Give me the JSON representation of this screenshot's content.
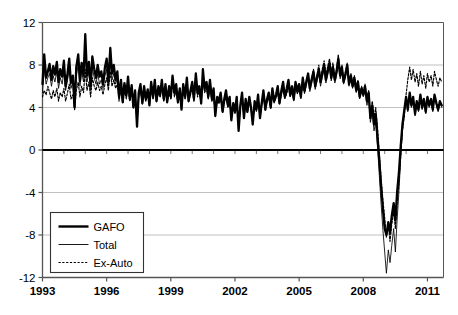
{
  "chart_data": {
    "type": "line",
    "title": "",
    "subtitle": "",
    "xlabel": "",
    "ylabel": "",
    "xlim": [
      1993.0,
      2011.75
    ],
    "ylim": [
      -12,
      12
    ],
    "ytick_values": [
      12,
      8,
      4,
      0,
      -4,
      -8,
      -12
    ],
    "ytick_labels": [
      "12",
      "8",
      "4",
      "0",
      "-4",
      "-8",
      "-12"
    ],
    "xtick_values": [
      1993,
      1996,
      1999,
      2002,
      2005,
      2008,
      2011
    ],
    "xtick_labels": [
      "1993",
      "1996",
      "1999",
      "2002",
      "2005",
      "2008",
      "2011"
    ],
    "minor_xtick_interval": 1,
    "grid": "horizontal-only",
    "grid_color": "#b0b0b0",
    "zero_line": true,
    "zero_line_color": "#000000",
    "axis_color": "#555555",
    "legend": {
      "position": "lower-left-inside",
      "border_color": "#333333",
      "entries": [
        {
          "label": "GAFO",
          "style": "thick-solid",
          "color": "#000000",
          "width": 2.4
        },
        {
          "label": "Total",
          "style": "thin-solid",
          "color": "#000000",
          "width": 0.9
        },
        {
          "label": "Ex-Auto",
          "style": "dotted",
          "color": "#000000",
          "width": 1.1
        }
      ]
    },
    "x": [
      1993.0,
      1993.08,
      1993.17,
      1993.25,
      1993.33,
      1993.42,
      1993.5,
      1993.58,
      1993.67,
      1993.75,
      1993.83,
      1993.92,
      1994.0,
      1994.08,
      1994.17,
      1994.25,
      1994.33,
      1994.42,
      1994.5,
      1994.58,
      1994.67,
      1994.75,
      1994.83,
      1994.92,
      1995.0,
      1995.08,
      1995.17,
      1995.25,
      1995.33,
      1995.42,
      1995.5,
      1995.58,
      1995.67,
      1995.75,
      1995.83,
      1995.92,
      1996.0,
      1996.08,
      1996.17,
      1996.25,
      1996.33,
      1996.42,
      1996.5,
      1996.58,
      1996.67,
      1996.75,
      1996.83,
      1996.92,
      1997.0,
      1997.08,
      1997.17,
      1997.25,
      1997.33,
      1997.42,
      1997.5,
      1997.58,
      1997.67,
      1997.75,
      1997.83,
      1997.92,
      1998.0,
      1998.08,
      1998.17,
      1998.25,
      1998.33,
      1998.42,
      1998.5,
      1998.58,
      1998.67,
      1998.75,
      1998.83,
      1998.92,
      1999.0,
      1999.08,
      1999.17,
      1999.25,
      1999.33,
      1999.42,
      1999.5,
      1999.58,
      1999.67,
      1999.75,
      1999.83,
      1999.92,
      2000.0,
      2000.08,
      2000.17,
      2000.25,
      2000.33,
      2000.42,
      2000.5,
      2000.58,
      2000.67,
      2000.75,
      2000.83,
      2000.92,
      2001.0,
      2001.08,
      2001.17,
      2001.25,
      2001.33,
      2001.42,
      2001.5,
      2001.58,
      2001.67,
      2001.75,
      2001.83,
      2001.92,
      2002.0,
      2002.08,
      2002.17,
      2002.25,
      2002.33,
      2002.42,
      2002.5,
      2002.58,
      2002.67,
      2002.75,
      2002.83,
      2002.92,
      2003.0,
      2003.08,
      2003.17,
      2003.25,
      2003.33,
      2003.42,
      2003.5,
      2003.58,
      2003.67,
      2003.75,
      2003.83,
      2003.92,
      2004.0,
      2004.08,
      2004.17,
      2004.25,
      2004.33,
      2004.42,
      2004.5,
      2004.58,
      2004.67,
      2004.75,
      2004.83,
      2004.92,
      2005.0,
      2005.08,
      2005.17,
      2005.25,
      2005.33,
      2005.42,
      2005.5,
      2005.58,
      2005.67,
      2005.75,
      2005.83,
      2005.92,
      2006.0,
      2006.08,
      2006.17,
      2006.25,
      2006.33,
      2006.42,
      2006.5,
      2006.58,
      2006.67,
      2006.75,
      2006.83,
      2006.92,
      2007.0,
      2007.08,
      2007.17,
      2007.25,
      2007.33,
      2007.42,
      2007.5,
      2007.58,
      2007.67,
      2007.75,
      2007.83,
      2007.92,
      2008.0,
      2008.08,
      2008.17,
      2008.25,
      2008.33,
      2008.42,
      2008.5,
      2008.58,
      2008.67,
      2008.75,
      2008.83,
      2008.92,
      2009.0,
      2009.08,
      2009.17,
      2009.25,
      2009.33,
      2009.42,
      2009.5,
      2009.58,
      2009.67,
      2009.75,
      2009.83,
      2009.92,
      2010.0,
      2010.08,
      2010.17,
      2010.25,
      2010.33,
      2010.42,
      2010.5,
      2010.58,
      2010.67,
      2010.75,
      2010.83,
      2010.92,
      2011.0,
      2011.08,
      2011.17,
      2011.25,
      2011.33,
      2011.42,
      2011.5,
      2011.58,
      2011.67
    ],
    "series": [
      {
        "name": "GAFO",
        "style": "thick-solid",
        "values": [
          6.2,
          9.0,
          6.8,
          7.4,
          8.1,
          6.6,
          7.9,
          7.1,
          8.3,
          6.4,
          7.6,
          6.9,
          8.4,
          6.0,
          7.2,
          8.6,
          6.3,
          7.0,
          4.0,
          7.8,
          9.0,
          6.5,
          8.2,
          7.0,
          10.9,
          7.0,
          8.3,
          6.0,
          8.8,
          7.6,
          6.8,
          8.0,
          6.9,
          7.4,
          6.2,
          7.8,
          8.6,
          6.4,
          9.6,
          7.2,
          8.0,
          6.6,
          7.4,
          5.0,
          6.6,
          4.5,
          6.3,
          5.2,
          6.9,
          4.8,
          6.1,
          4.0,
          5.6,
          2.2,
          5.4,
          6.2,
          4.4,
          6.0,
          4.8,
          5.7,
          4.2,
          6.4,
          5.0,
          6.6,
          4.6,
          6.0,
          5.2,
          6.6,
          4.8,
          6.2,
          4.5,
          6.0,
          5.0,
          7.0,
          5.4,
          6.2,
          4.5,
          5.8,
          3.8,
          6.2,
          5.0,
          6.8,
          4.6,
          5.6,
          6.4,
          4.8,
          7.2,
          5.4,
          6.0,
          4.4,
          7.6,
          5.8,
          6.4,
          5.0,
          6.6,
          4.8,
          5.8,
          3.2,
          5.0,
          4.6,
          5.4,
          3.6,
          4.8,
          5.6,
          4.2,
          5.0,
          2.8,
          4.4,
          3.6,
          5.0,
          1.8,
          4.2,
          5.4,
          3.0,
          4.8,
          3.6,
          5.0,
          4.0,
          2.4,
          4.6,
          3.8,
          5.2,
          3.0,
          4.4,
          5.6,
          3.8,
          4.8,
          5.4,
          4.0,
          5.8,
          4.6,
          5.2,
          6.0,
          4.4,
          5.6,
          6.4,
          5.0,
          5.8,
          6.6,
          5.2,
          6.0,
          4.8,
          6.4,
          5.6,
          6.2,
          5.0,
          6.8,
          5.6,
          6.4,
          7.2,
          5.8,
          6.6,
          7.4,
          6.0,
          6.8,
          7.6,
          6.4,
          7.2,
          8.0,
          6.6,
          7.4,
          8.2,
          6.8,
          7.8,
          6.6,
          7.4,
          8.6,
          7.0,
          7.8,
          6.4,
          7.2,
          8.0,
          6.2,
          7.0,
          6.0,
          6.8,
          5.6,
          6.4,
          5.0,
          5.8,
          5.2,
          6.0,
          4.6,
          5.4,
          3.0,
          4.2,
          2.4,
          3.4,
          1.0,
          -1.0,
          -3.4,
          -5.6,
          -7.4,
          -8.0,
          -6.8,
          -7.8,
          -6.2,
          -5.0,
          -6.6,
          -4.0,
          -2.0,
          0.4,
          2.4,
          3.8,
          5.0,
          3.8,
          5.4,
          4.2,
          5.0,
          3.4,
          4.6,
          3.8,
          5.2,
          4.0,
          4.8,
          3.6,
          5.0,
          4.2,
          4.8,
          3.8,
          5.2,
          4.4,
          3.8,
          4.6,
          4.2
        ]
      },
      {
        "name": "Total",
        "style": "thin-solid",
        "values": [
          5.4,
          7.6,
          6.2,
          6.8,
          7.2,
          6.0,
          7.0,
          6.4,
          7.4,
          5.8,
          6.8,
          6.2,
          7.4,
          5.6,
          6.6,
          7.6,
          5.8,
          6.4,
          3.8,
          7.0,
          8.0,
          6.0,
          7.4,
          6.4,
          9.4,
          6.4,
          7.4,
          5.6,
          7.8,
          6.8,
          6.2,
          7.2,
          6.2,
          6.6,
          5.8,
          7.0,
          7.6,
          6.0,
          8.4,
          6.6,
          7.2,
          6.2,
          6.8,
          4.8,
          6.2,
          4.4,
          6.0,
          5.0,
          6.4,
          4.6,
          5.8,
          4.0,
          5.4,
          2.4,
          5.2,
          5.8,
          4.3,
          5.6,
          4.6,
          5.4,
          4.2,
          6.0,
          4.8,
          6.2,
          4.5,
          5.6,
          5.0,
          6.2,
          4.6,
          5.8,
          4.4,
          5.6,
          4.8,
          6.6,
          5.2,
          5.8,
          4.4,
          5.4,
          3.8,
          5.8,
          4.8,
          6.4,
          4.5,
          5.4,
          6.0,
          4.6,
          6.8,
          5.2,
          5.7,
          4.3,
          7.0,
          5.5,
          6.0,
          4.8,
          6.2,
          4.6,
          5.4,
          3.2,
          4.8,
          4.4,
          5.0,
          3.5,
          4.6,
          5.2,
          4.0,
          4.8,
          2.9,
          4.2,
          3.4,
          4.8,
          2.0,
          4.0,
          5.0,
          3.0,
          4.5,
          3.5,
          4.7,
          3.8,
          2.5,
          4.3,
          3.6,
          4.8,
          3.0,
          4.2,
          5.2,
          3.7,
          4.6,
          5.0,
          3.9,
          5.4,
          4.4,
          5.0,
          5.6,
          4.3,
          5.2,
          6.0,
          4.8,
          5.4,
          6.2,
          5.0,
          5.6,
          4.6,
          6.0,
          5.3,
          5.8,
          4.8,
          6.4,
          5.3,
          6.0,
          6.8,
          5.5,
          6.2,
          7.0,
          5.7,
          6.4,
          7.2,
          6.0,
          6.8,
          7.6,
          6.3,
          7.0,
          7.8,
          6.5,
          7.4,
          6.3,
          7.0,
          8.2,
          6.7,
          7.4,
          6.2,
          6.9,
          7.6,
          6.0,
          6.7,
          5.8,
          6.5,
          5.4,
          6.2,
          4.8,
          5.6,
          5.0,
          5.6,
          4.2,
          5.0,
          2.6,
          3.6,
          1.8,
          2.6,
          0.2,
          -2.4,
          -5.0,
          -7.6,
          -9.6,
          -11.6,
          -9.4,
          -10.6,
          -9.0,
          -7.4,
          -9.6,
          -6.6,
          -3.8,
          -0.6,
          2.0,
          3.6,
          4.8,
          3.6,
          5.2,
          4.0,
          4.8,
          3.2,
          4.4,
          3.6,
          5.0,
          3.8,
          4.6,
          3.4,
          4.8,
          4.0,
          4.6,
          3.6,
          5.0,
          4.2,
          3.6,
          4.4,
          4.0
        ]
      },
      {
        "name": "Ex-Auto",
        "style": "dotted",
        "values": [
          5.0,
          5.6,
          5.2,
          6.0,
          5.4,
          4.8,
          5.6,
          5.0,
          5.8,
          4.6,
          5.4,
          5.0,
          5.8,
          4.6,
          5.4,
          6.2,
          4.8,
          5.2,
          3.8,
          5.6,
          6.4,
          5.0,
          6.0,
          5.4,
          7.6,
          5.6,
          6.4,
          5.0,
          6.8,
          6.0,
          5.6,
          6.4,
          5.6,
          6.0,
          5.2,
          6.2,
          6.8,
          5.6,
          7.4,
          6.0,
          6.6,
          5.8,
          6.2,
          4.6,
          5.8,
          4.4,
          5.6,
          4.8,
          6.0,
          4.6,
          5.6,
          4.2,
          5.2,
          2.8,
          5.0,
          5.6,
          4.4,
          5.4,
          4.6,
          5.2,
          4.4,
          5.8,
          4.8,
          6.0,
          4.6,
          5.4,
          5.0,
          6.0,
          4.6,
          5.6,
          4.5,
          5.4,
          4.8,
          6.2,
          5.0,
          5.6,
          4.4,
          5.2,
          4.0,
          5.6,
          4.8,
          6.0,
          4.6,
          5.2,
          5.8,
          4.6,
          6.4,
          5.0,
          5.6,
          4.4,
          6.6,
          5.4,
          5.8,
          4.8,
          6.0,
          4.6,
          5.2,
          3.4,
          4.6,
          4.4,
          4.8,
          3.6,
          4.4,
          5.0,
          4.0,
          4.6,
          3.2,
          4.2,
          3.6,
          4.6,
          2.6,
          4.0,
          4.8,
          3.2,
          4.4,
          3.6,
          4.6,
          3.9,
          2.9,
          4.3,
          3.8,
          4.7,
          3.2,
          4.3,
          5.0,
          3.8,
          4.6,
          4.9,
          4.0,
          5.2,
          4.5,
          4.9,
          5.4,
          4.4,
          5.2,
          5.8,
          4.9,
          5.3,
          6.0,
          5.0,
          5.5,
          4.7,
          5.9,
          5.3,
          5.8,
          5.0,
          6.4,
          5.4,
          6.2,
          7.0,
          5.8,
          6.6,
          7.6,
          6.2,
          7.0,
          8.0,
          6.6,
          7.6,
          8.4,
          7.0,
          7.8,
          8.6,
          7.2,
          8.2,
          6.8,
          7.6,
          9.0,
          7.2,
          8.0,
          6.6,
          7.4,
          8.2,
          6.4,
          7.2,
          6.2,
          7.0,
          5.8,
          6.6,
          5.2,
          6.0,
          5.4,
          6.2,
          4.8,
          5.6,
          3.4,
          4.6,
          3.0,
          4.0,
          2.0,
          -0.4,
          -2.6,
          -4.8,
          -6.4,
          -8.2,
          -7.0,
          -8.6,
          -7.0,
          -5.8,
          -7.4,
          -5.0,
          -3.0,
          -0.6,
          1.8,
          3.2,
          5.2,
          6.6,
          7.8,
          6.6,
          7.6,
          6.4,
          7.2,
          6.0,
          7.4,
          6.2,
          7.0,
          5.8,
          7.2,
          6.4,
          7.0,
          6.0,
          7.4,
          6.6,
          6.0,
          6.8,
          6.4
        ]
      }
    ]
  }
}
